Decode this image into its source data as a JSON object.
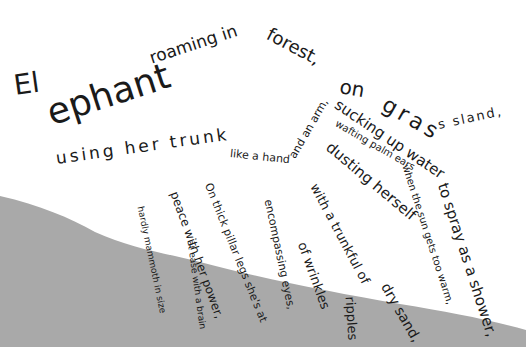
{
  "poem": {
    "title_word": "Elephant",
    "fragments": [
      {
        "id": "elephant-el",
        "text": "El"
      },
      {
        "id": "elephant-ephant",
        "text": "ephant"
      },
      {
        "id": "roaming",
        "text": "roaming in"
      },
      {
        "id": "forest",
        "text": "forest,"
      },
      {
        "id": "on",
        "text": "on"
      },
      {
        "id": "grass",
        "text": "gras"
      },
      {
        "id": "sland",
        "text": "s sland,"
      },
      {
        "id": "using",
        "text": "using her trunk"
      },
      {
        "id": "like",
        "text": "like a hand"
      },
      {
        "id": "and-an-arm",
        "text": "and an arm,"
      },
      {
        "id": "sucking",
        "text": "sucking up water"
      },
      {
        "id": "to-spray",
        "text": "to spray as a shower,"
      },
      {
        "id": "wafting",
        "text": "wafting palm ears"
      },
      {
        "id": "when",
        "text": "when the sun gets too warm,"
      },
      {
        "id": "dusting",
        "text": "dusting herself"
      },
      {
        "id": "with-trunkful",
        "text": "with a trunkful of"
      },
      {
        "id": "dry-sand",
        "text": "dry sand,"
      },
      {
        "id": "ripples",
        "text": "ripples"
      },
      {
        "id": "of-wrinkles",
        "text": "of wrinkles"
      },
      {
        "id": "encompassing",
        "text": "encompassing eyes,"
      },
      {
        "id": "on-thick",
        "text": "On thick pillar legs she's at"
      },
      {
        "id": "peace",
        "text": "peace with her power,"
      },
      {
        "id": "at-ease",
        "text": "at ease with a brain"
      },
      {
        "id": "hardly",
        "text": "hardly mammoth in size"
      }
    ]
  },
  "colors": {
    "background": "#ffffff",
    "ground": "#a9a9a9",
    "text": "#1a1a1a"
  }
}
